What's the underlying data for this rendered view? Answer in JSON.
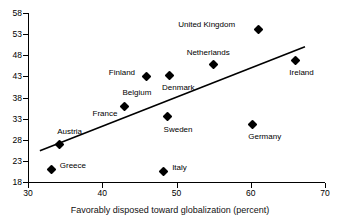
{
  "chart_data": {
    "type": "scatter",
    "title": "",
    "xlabel": "Favorably disposed toward globalization (percent)",
    "ylabel": "",
    "xlim": [
      30,
      70
    ],
    "ylim": [
      18,
      58
    ],
    "xticks": [
      30,
      40,
      50,
      60,
      70
    ],
    "yticks": [
      18,
      23,
      28,
      33,
      38,
      43,
      48,
      53,
      58
    ],
    "grid": false,
    "legend": "none",
    "points": [
      {
        "label": "Greece",
        "x": 33.2,
        "y": 21.0,
        "label_dx": 8,
        "label_dy": -3
      },
      {
        "label": "Austria",
        "x": 34.2,
        "y": 26.8,
        "label_dx": -2,
        "label_dy": -13
      },
      {
        "label": "Belgium",
        "x": 43.0,
        "y": 35.8,
        "label_dx": -2,
        "label_dy": -14
      },
      {
        "label": "France",
        "x": 43.0,
        "y": 35.8,
        "label_dx": -32,
        "label_dy": 7
      },
      {
        "label": "Finland",
        "x": 46.0,
        "y": 43.0,
        "label_dx": -38,
        "label_dy": -3
      },
      {
        "label": "Denmark",
        "x": 49.0,
        "y": 43.2,
        "label_dx": -7,
        "label_dy": 12
      },
      {
        "label": "Sweden",
        "x": 48.8,
        "y": 33.5,
        "label_dx": -4,
        "label_dy": 13
      },
      {
        "label": "Italy",
        "x": 48.2,
        "y": 20.5,
        "label_dx": 9,
        "label_dy": -3
      },
      {
        "label": "Netherlands",
        "x": 55.0,
        "y": 45.7,
        "label_dx": -27,
        "label_dy": -12
      },
      {
        "label": "Germany",
        "x": 60.2,
        "y": 31.7,
        "label_dx": -4,
        "label_dy": 13
      },
      {
        "label": "United Kingdom",
        "x": 61.0,
        "y": 54.1,
        "label_dx": -80,
        "label_dy": -4
      },
      {
        "label": "Ireland",
        "x": 66.0,
        "y": 46.8,
        "label_dx": -6,
        "label_dy": 13
      }
    ],
    "trendline": {
      "x_start": 31.6,
      "y_start": 25.4,
      "x_end": 67.3,
      "y_end": 50.0
    },
    "colors": {
      "marker": "#000000",
      "axis": "#000000",
      "trendline": "#000000",
      "background": "#ffffff"
    }
  }
}
